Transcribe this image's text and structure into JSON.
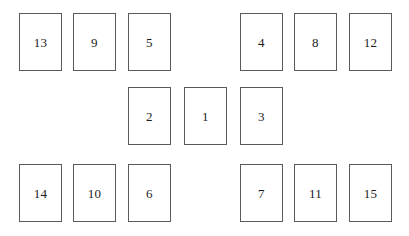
{
  "canvas": {
    "width": 409,
    "height": 236,
    "background": "#ffffff"
  },
  "style": {
    "card_background": "#ffffff",
    "card_border_color": "#5a5a5a",
    "card_border_width": 1,
    "label_color": "#1c1c1c",
    "card_width": 43,
    "card_height": 58
  },
  "layout": {
    "rows": [
      {
        "name": "top-row",
        "y": 13
      },
      {
        "name": "middle-row",
        "y": 87
      },
      {
        "name": "bottom-row",
        "y": 164
      }
    ]
  },
  "cards": [
    {
      "id": "card-13",
      "label": "13",
      "x": 19,
      "y": 13,
      "row": "top",
      "group": "left"
    },
    {
      "id": "card-9",
      "label": "9",
      "x": 73,
      "y": 13,
      "row": "top",
      "group": "left"
    },
    {
      "id": "card-5",
      "label": "5",
      "x": 128,
      "y": 13,
      "row": "top",
      "group": "left"
    },
    {
      "id": "card-4",
      "label": "4",
      "x": 240,
      "y": 13,
      "row": "top",
      "group": "right"
    },
    {
      "id": "card-8",
      "label": "8",
      "x": 294,
      "y": 13,
      "row": "top",
      "group": "right"
    },
    {
      "id": "card-12",
      "label": "12",
      "x": 349,
      "y": 13,
      "row": "top",
      "group": "right"
    },
    {
      "id": "card-2",
      "label": "2",
      "x": 128,
      "y": 87,
      "row": "middle",
      "group": "center"
    },
    {
      "id": "card-1",
      "label": "1",
      "x": 184,
      "y": 87,
      "row": "middle",
      "group": "center"
    },
    {
      "id": "card-3",
      "label": "3",
      "x": 240,
      "y": 87,
      "row": "middle",
      "group": "center"
    },
    {
      "id": "card-14",
      "label": "14",
      "x": 19,
      "y": 164,
      "row": "bottom",
      "group": "left"
    },
    {
      "id": "card-10",
      "label": "10",
      "x": 73,
      "y": 164,
      "row": "bottom",
      "group": "left"
    },
    {
      "id": "card-6",
      "label": "6",
      "x": 128,
      "y": 164,
      "row": "bottom",
      "group": "left"
    },
    {
      "id": "card-7",
      "label": "7",
      "x": 240,
      "y": 164,
      "row": "bottom",
      "group": "right"
    },
    {
      "id": "card-11",
      "label": "11",
      "x": 294,
      "y": 164,
      "row": "bottom",
      "group": "right"
    },
    {
      "id": "card-15",
      "label": "15",
      "x": 349,
      "y": 164,
      "row": "bottom",
      "group": "right"
    }
  ]
}
